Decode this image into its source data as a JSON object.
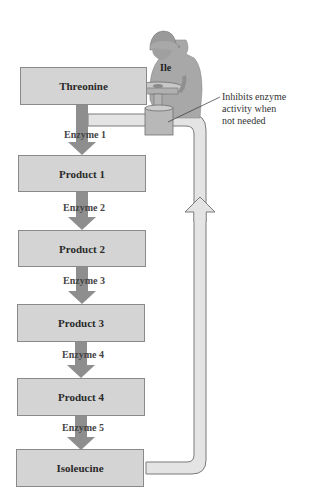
{
  "diagram": {
    "pathway": [
      {
        "label": "Threonine"
      },
      {
        "label": "Product 1"
      },
      {
        "label": "Product 2"
      },
      {
        "label": "Product 3"
      },
      {
        "label": "Product 4"
      },
      {
        "label": "Isoleucine"
      }
    ],
    "enzymes": [
      "Enzyme 1",
      "Enzyme 2",
      "Enzyme 3",
      "Enzyme 4",
      "Enzyme 5"
    ],
    "inhibitor_label": "Ile",
    "annotation": [
      "Inhibits enzyme",
      "activity when",
      "not needed"
    ],
    "colors": {
      "box_fill": "#d4d4d4",
      "arrow": "#8e8e8e",
      "pipe_fill": "#e4e4e4",
      "figure": "#a8a8a8"
    }
  }
}
